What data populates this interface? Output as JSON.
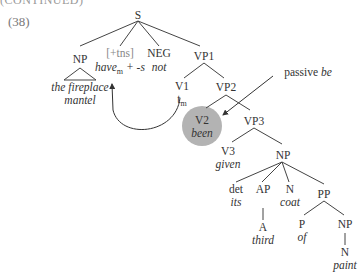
{
  "header": {
    "cut_text": "(CONTINUED)",
    "example_number": "(38)"
  },
  "tree": {
    "S": "S",
    "NP": "NP",
    "NP_leaf_line1": "the fireplace",
    "NP_leaf_line2": "mantel",
    "tns": "[+tns]",
    "tns_word": "have",
    "tns_sub": "m",
    "tns_suffix": " + -s",
    "NEG": "NEG",
    "NEG_word": "not",
    "VP1": "VP1",
    "V1": "V1",
    "V1_trace": "t",
    "V1_trace_sub": "m",
    "VP2": "VP2",
    "V2": "V2",
    "V2_word": "been",
    "annotation_plain": "passive ",
    "annotation_italic": "be",
    "VP3": "VP3",
    "V3": "V3",
    "V3_word": "given",
    "NP2": "NP",
    "det": "det",
    "det_word": "its",
    "AP": "AP",
    "A": "A",
    "A_word": "third",
    "N": "N",
    "N_word": "coat",
    "PP": "PP",
    "P": "P",
    "P_word": "of",
    "NP3": "NP",
    "N2": "N",
    "N2_word": "paint"
  },
  "colors": {
    "circle": "#b3b3b3",
    "lines": "#444444"
  }
}
